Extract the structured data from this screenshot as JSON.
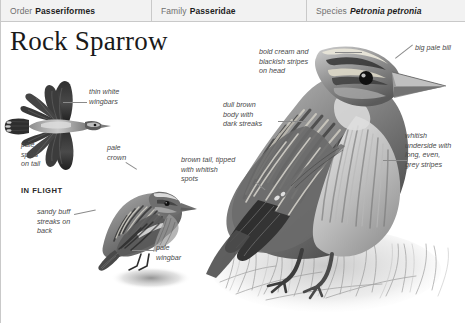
{
  "taxonomy": {
    "cells": [
      {
        "key": "Order",
        "value": "Passeriformes",
        "italic": false
      },
      {
        "key": "Family",
        "value": "Passeridae",
        "italic": false
      },
      {
        "key": "Species",
        "value": "Petronia petronia",
        "italic": true
      }
    ]
  },
  "title": "Rock Sparrow",
  "annotations": {
    "thin_white_wingbars": "thin white\nwingbars",
    "pale_spots_on_tail": "pale\nspots\non tail",
    "in_flight": "IN FLIGHT",
    "pale_crown": "pale\ncrown",
    "sandy_buff_streaks": "sandy buff\nstreaks on\nback",
    "pale_wingbar": "pale\nwingbar",
    "bold_cream_stripes": "bold cream and\nblackish stripes\non head",
    "big_pale_bill": "big pale bill",
    "dull_brown_body": "dull brown\nbody with\ndark streaks",
    "brown_tail": "brown tail, tipped\nwith whitish\nspots",
    "whitish_underside": "whitish\nunderside with\nlong, even,\ngrey stripes"
  },
  "illustrations": {
    "flight_bird": "rock-sparrow-in-flight",
    "perched_small_bird": "rock-sparrow-perched-small",
    "perched_large_bird": "rock-sparrow-perched-large"
  },
  "colors": {
    "header_bg": "#f2f2f2",
    "header_rule": "#c9c9c9",
    "key_text": "#6f6f6f",
    "value_text": "#1d1d1d",
    "note_text": "#4a4a4a",
    "leader_line": "#8a8a8a",
    "plumage_dark": "#3a3a3a",
    "plumage_mid": "#8e8e8e",
    "plumage_light": "#d8d8d8"
  }
}
